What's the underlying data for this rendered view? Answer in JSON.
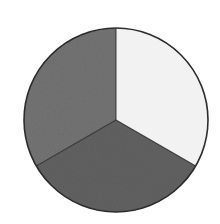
{
  "image": {
    "kind": "scanned-pie-chart",
    "background_color": "#ffffff",
    "width": 220,
    "height": 224,
    "texture": "scan-grain"
  },
  "geometry": {
    "center_x": 116,
    "center_y": 120,
    "radius": 92,
    "outline_color": "#2b2b2b",
    "outline_width": 1.6,
    "start_angle_deg": -90
  },
  "chart_data": {
    "type": "pie",
    "title": "",
    "subtitle": "",
    "xlabel": "",
    "ylabel": "",
    "grid": false,
    "legend": "none",
    "labels": [
      "Segment 1",
      "Segment 2",
      "Segment 3"
    ],
    "values": [
      33.3,
      33.3,
      33.3
    ],
    "percentages": [
      "33.3%",
      "33.3%",
      "33.3%"
    ],
    "angles_deg": [
      120,
      120,
      120
    ],
    "colors": [
      "#f2f2f2",
      "#5c5c5c",
      "#6d6d6d"
    ],
    "slices": [
      {
        "label": "Segment 1",
        "value": 33.3,
        "percent": "33.3%",
        "color": "#f2f2f2",
        "position": "right",
        "start_angle_deg": -90,
        "end_angle_deg": 30,
        "path": "M 116 120 L 116 28 A 92 92 0 0 1 195.68 166 Z"
      },
      {
        "label": "Segment 2",
        "value": 33.3,
        "percent": "33.3%",
        "color": "#5c5c5c",
        "position": "bottom",
        "start_angle_deg": 30,
        "end_angle_deg": 150,
        "path": "M 116 120 L 195.68 166 A 92 92 0 0 1 36.32 166 Z"
      },
      {
        "label": "Segment 3",
        "value": 33.3,
        "percent": "33.3%",
        "color": "#6d6d6d",
        "position": "left",
        "start_angle_deg": 150,
        "end_angle_deg": 270,
        "path": "M 116 120 L 36.32 166 A 92 92 0 0 1 116 28 Z"
      }
    ]
  }
}
